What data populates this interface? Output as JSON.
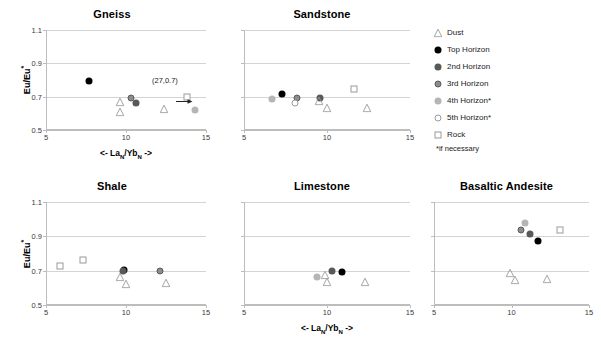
{
  "axes": {
    "ylabel": "Eu/Eu*",
    "xlabel_prefix": "<- La",
    "xlabel_sub1": "N",
    "xlabel_mid": "/Yb",
    "xlabel_sub2": "N",
    "xlabel_suffix": " ->",
    "ylim": [
      0.5,
      1.1
    ],
    "xlim": [
      5,
      15
    ],
    "yticks": [
      "0.5",
      "0.7",
      "0.9",
      "1.1"
    ],
    "ytick_values": [
      0.5,
      0.7,
      0.9,
      1.1
    ],
    "xticks": [
      "5",
      "10",
      "15"
    ],
    "xtick_values": [
      5,
      10,
      15
    ]
  },
  "legend": {
    "items": [
      {
        "label": "Dust",
        "marker": "open-triangle",
        "key": "dust"
      },
      {
        "label": "Top Horizon",
        "marker": "filled-circle",
        "key": "top"
      },
      {
        "label": "2nd Horizon",
        "marker": "darkgray-circle",
        "key": "h2"
      },
      {
        "label": "3rd Horizon",
        "marker": "ringed-circle",
        "key": "h3"
      },
      {
        "label": "4th Horizon*",
        "marker": "lightgray-circle",
        "key": "h4"
      },
      {
        "label": "5th Horizon*",
        "marker": "open-circle",
        "key": "h5"
      },
      {
        "label": "Rock",
        "marker": "open-square",
        "key": "rock"
      }
    ],
    "note": "*if necessary"
  },
  "colors": {
    "top": "#000000",
    "h2": "#595959",
    "h3": "#8c8c8c",
    "h4": "#b5b5b5",
    "h5": "#ffffff",
    "rock": "#ffffff",
    "dust": "#9a9a9a",
    "gridline": "#d4d4d4",
    "axis": "#bdbdbd"
  },
  "chart_data": [
    {
      "type": "scatter",
      "title": "Gneiss",
      "xlabel": "<- La_N/Yb_N ->",
      "ylabel": "Eu/Eu*",
      "xlim": [
        5,
        15
      ],
      "ylim": [
        0.5,
        1.1
      ],
      "grid": true,
      "annotation": {
        "text": "(27,0.7)",
        "x": 13.0,
        "y": 0.79,
        "arrow": "right"
      },
      "series": [
        {
          "name": "Top Horizon",
          "key": "top",
          "points": [
            [
              7.7,
              0.795
            ]
          ]
        },
        {
          "name": "2nd Horizon",
          "key": "h2",
          "points": [
            [
              10.6,
              0.665
            ]
          ]
        },
        {
          "name": "3rd Horizon",
          "key": "h3",
          "points": [
            [
              10.3,
              0.695
            ]
          ]
        },
        {
          "name": "4th Horizon*",
          "key": "h4",
          "points": [
            [
              14.3,
              0.62
            ]
          ]
        },
        {
          "name": "Dust",
          "key": "dust",
          "points": [
            [
              9.6,
              0.7
            ],
            [
              9.6,
              0.64
            ],
            [
              12.4,
              0.655
            ]
          ]
        },
        {
          "name": "Rock",
          "key": "rock",
          "points": [
            [
              13.8,
              0.7
            ]
          ]
        }
      ]
    },
    {
      "type": "scatter",
      "title": "Sandstone",
      "xlabel": "<- La_N/Yb_N ->",
      "ylabel": "Eu/Eu*",
      "xlim": [
        5,
        15
      ],
      "ylim": [
        0.5,
        1.1
      ],
      "grid": true,
      "series": [
        {
          "name": "Top Horizon",
          "key": "top",
          "points": [
            [
              7.3,
              0.715
            ]
          ]
        },
        {
          "name": "2nd Horizon",
          "key": "h2",
          "points": [
            [
              9.6,
              0.695
            ]
          ]
        },
        {
          "name": "3rd Horizon",
          "key": "h3",
          "points": [
            [
              8.2,
              0.69
            ]
          ]
        },
        {
          "name": "4th Horizon*",
          "key": "h4",
          "points": [
            [
              6.7,
              0.685
            ]
          ]
        },
        {
          "name": "5th Horizon*",
          "key": "h5",
          "points": [
            [
              8.1,
              0.66
            ]
          ]
        },
        {
          "name": "Dust",
          "key": "dust",
          "points": [
            [
              9.5,
              0.705
            ],
            [
              10.0,
              0.66
            ],
            [
              12.4,
              0.66
            ]
          ]
        },
        {
          "name": "Rock",
          "key": "rock",
          "points": [
            [
              11.6,
              0.745
            ]
          ]
        }
      ]
    },
    {
      "type": "scatter",
      "title": "Shale",
      "xlabel": "<- La_N/Yb_N ->",
      "ylabel": "Eu/Eu*",
      "xlim": [
        5,
        15
      ],
      "ylim": [
        0.5,
        1.1
      ],
      "grid": true,
      "series": [
        {
          "name": "Top Horizon",
          "key": "top",
          "points": [
            [
              9.9,
              0.705
            ]
          ]
        },
        {
          "name": "2nd Horizon",
          "key": "h2",
          "points": [
            [
              9.8,
              0.7
            ]
          ]
        },
        {
          "name": "3rd Horizon",
          "key": "h3",
          "points": [
            [
              12.1,
              0.7
            ]
          ]
        },
        {
          "name": "Dust",
          "key": "dust",
          "points": [
            [
              9.6,
              0.695
            ],
            [
              10.0,
              0.65
            ],
            [
              12.5,
              0.655
            ]
          ]
        },
        {
          "name": "Rock",
          "key": "rock",
          "points": [
            [
              5.9,
              0.73
            ],
            [
              7.3,
              0.765
            ]
          ]
        }
      ]
    },
    {
      "type": "scatter",
      "title": "Limestone",
      "xlabel": "<- La_N/Yb_N ->",
      "ylabel": "Eu/Eu*",
      "xlim": [
        5,
        15
      ],
      "ylim": [
        0.5,
        1.1
      ],
      "grid": true,
      "series": [
        {
          "name": "Top Horizon",
          "key": "top",
          "points": [
            [
              10.9,
              0.69
            ]
          ]
        },
        {
          "name": "2nd Horizon",
          "key": "h2",
          "points": [
            [
              10.3,
              0.7
            ]
          ]
        },
        {
          "name": "4th Horizon*",
          "key": "h4",
          "points": [
            [
              9.4,
              0.665
            ]
          ]
        },
        {
          "name": "Dust",
          "key": "dust",
          "points": [
            [
              9.9,
              0.705
            ],
            [
              10.0,
              0.665
            ],
            [
              12.3,
              0.665
            ]
          ]
        }
      ]
    },
    {
      "type": "scatter",
      "title": "Basaltic Andesite",
      "xlabel": "<- La_N/Yb_N ->",
      "ylabel": "Eu/Eu*",
      "xlim": [
        5,
        15
      ],
      "ylim": [
        0.5,
        1.1
      ],
      "grid": true,
      "series": [
        {
          "name": "Top Horizon",
          "key": "top",
          "points": [
            [
              11.7,
              0.875
            ]
          ]
        },
        {
          "name": "2nd Horizon",
          "key": "h2",
          "points": [
            [
              11.2,
              0.915
            ]
          ]
        },
        {
          "name": "3rd Horizon",
          "key": "h3",
          "points": [
            [
              10.6,
              0.935
            ]
          ]
        },
        {
          "name": "4th Horizon*",
          "key": "h4",
          "points": [
            [
              10.9,
              0.975
            ]
          ]
        },
        {
          "name": "Dust",
          "key": "dust",
          "points": [
            [
              9.9,
              0.715
            ],
            [
              10.2,
              0.675
            ],
            [
              12.3,
              0.68
            ]
          ]
        },
        {
          "name": "Rock",
          "key": "rock",
          "points": [
            [
              13.1,
              0.935
            ]
          ]
        }
      ]
    }
  ]
}
